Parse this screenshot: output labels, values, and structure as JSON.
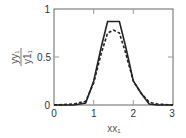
{
  "chart_data": {
    "type": "line",
    "title": "",
    "xlabel": "xx₁",
    "ylabel_numerator": "yy₁",
    "ylabel_denominator": "y1₁",
    "xlim": [
      0,
      3
    ],
    "ylim": [
      0,
      1
    ],
    "xticks": [
      "0",
      "1",
      "2",
      "3"
    ],
    "yticks": [
      "0",
      "0.5",
      "1"
    ],
    "grid": false,
    "legend": null,
    "series": [
      {
        "name": "solid",
        "style": "solid",
        "color": "#222222",
        "x": [
          0,
          0.5,
          0.8,
          1.0,
          1.2,
          1.35,
          1.65,
          1.8,
          2.0,
          2.2,
          2.4,
          2.6,
          3.0
        ],
        "y": [
          0,
          0,
          0.02,
          0.25,
          0.62,
          0.87,
          0.87,
          0.62,
          0.25,
          0.12,
          0.01,
          0,
          0
        ]
      },
      {
        "name": "dashed",
        "style": "dashed",
        "color": "#222222",
        "x": [
          0,
          0.5,
          0.8,
          1.0,
          1.2,
          1.35,
          1.5,
          1.65,
          1.8,
          2.0,
          2.2,
          2.4,
          2.6,
          3.0
        ],
        "y": [
          0,
          0.01,
          0.04,
          0.23,
          0.55,
          0.75,
          0.78,
          0.75,
          0.55,
          0.25,
          0.12,
          0.03,
          0.01,
          0
        ]
      }
    ]
  },
  "axes": {
    "x_tick_labels": [
      "0",
      "1",
      "2",
      "3"
    ],
    "y_tick_labels": [
      "0",
      "0.5",
      "1"
    ],
    "xlabel": "xx₁",
    "ylabel_numerator": "yy₁",
    "ylabel_denominator": "y1₁"
  }
}
